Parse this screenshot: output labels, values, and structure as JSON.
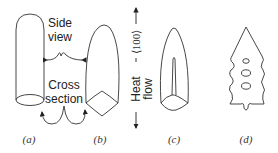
{
  "figure": {
    "annotations": {
      "side_view_line1": "Side",
      "side_view_line2": "view",
      "cross_section_line1": "Cross",
      "cross_section_line2": "section",
      "direction": "⟨100⟩",
      "heat_flow_line1": "Heat",
      "heat_flow_line2": "flow"
    },
    "panels": [
      {
        "label": "(a)",
        "description": "cylindrical dendrite tip with circular cross section"
      },
      {
        "label": "(b)",
        "description": "paraboloid tip with four-fold cross section"
      },
      {
        "label": "(c)",
        "description": "tip with central ridge"
      },
      {
        "label": "(d)",
        "description": "dendrite with side branches"
      }
    ]
  }
}
